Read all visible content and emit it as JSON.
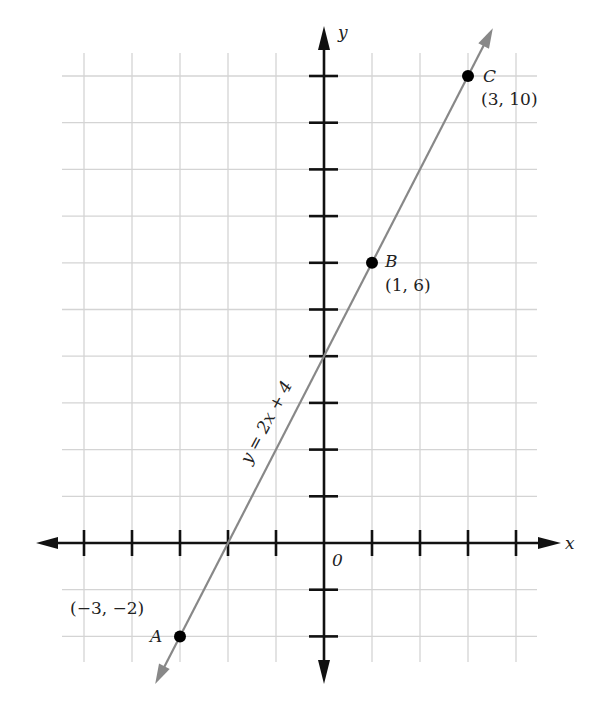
{
  "chart_data": {
    "type": "line",
    "title": "",
    "xlabel": "x",
    "ylabel": "y",
    "origin_label": "0",
    "equation_label": "y = 2x + 4",
    "xlim": [
      -5.5,
      4.5
    ],
    "ylim": [
      -2.5,
      10.5
    ],
    "grid": true,
    "x_ticks": [
      -5,
      -4,
      -3,
      -2,
      -1,
      1,
      2,
      3,
      4
    ],
    "y_ticks": [
      -2,
      -1,
      1,
      2,
      3,
      4,
      5,
      6,
      7,
      8,
      9,
      10
    ],
    "series": [
      {
        "name": "y = 2x + 4",
        "slope": 2,
        "intercept": 4,
        "x": [
          -3.35,
          3.35
        ],
        "color": "#888888"
      }
    ],
    "points": [
      {
        "name": "A",
        "x": -3,
        "y": -2,
        "coord_label": "(−3, −2)"
      },
      {
        "name": "B",
        "x": 1,
        "y": 6,
        "coord_label": "(1, 6)"
      },
      {
        "name": "C",
        "x": 3,
        "y": 10,
        "coord_label": "(3, 10)"
      }
    ]
  }
}
